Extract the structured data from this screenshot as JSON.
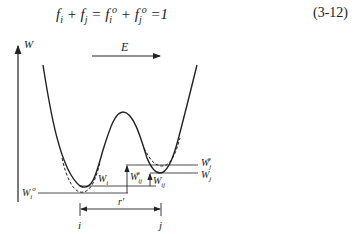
{
  "equation": {
    "text": "f_i + f_j = f_i° + f_j° = 1",
    "number": "(3-12)"
  },
  "figure": {
    "y_axis_label": "W",
    "field_label": "E",
    "labels": {
      "W_i_zero": "W",
      "W_i_zero_sub": "i",
      "W_i": "W",
      "W_i_sub": "i",
      "W_ij_zero": "W",
      "W_ij_zero_sub": "ij",
      "W_ij": "W",
      "W_ij_sub": "ij",
      "W_j_zero": "W",
      "W_j_zero_sub": "j",
      "W_j": "W",
      "W_j_sub": "j",
      "distance": "r'",
      "site_i": "i",
      "site_j": "j"
    },
    "colors": {
      "line": "#222222",
      "background": "#ffffff"
    }
  }
}
